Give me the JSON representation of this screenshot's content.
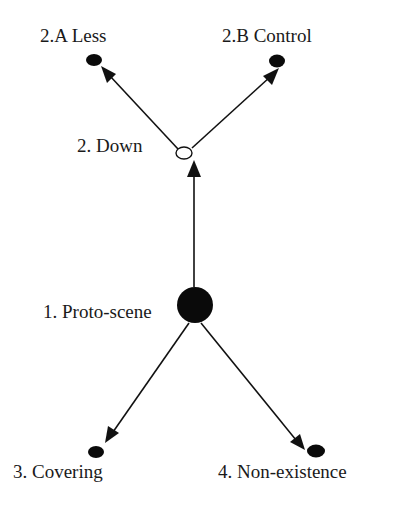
{
  "diagram": {
    "type": "radial-network",
    "colors": {
      "ink": "#111111",
      "text": "#1a1a1a",
      "background": "#ffffff"
    },
    "nodes": [
      {
        "id": "proto",
        "label": "1. Proto-scene",
        "style": "filled-large"
      },
      {
        "id": "down",
        "label": "2. Down",
        "style": "open-small"
      },
      {
        "id": "less",
        "label": "2.A Less",
        "style": "filled-small"
      },
      {
        "id": "control",
        "label": "2.B Control",
        "style": "filled-small"
      },
      {
        "id": "covering",
        "label": "3. Covering",
        "style": "filled-small"
      },
      {
        "id": "nonexistence",
        "label": "4. Non-existence",
        "style": "filled-small"
      }
    ],
    "edges": [
      {
        "from": "proto",
        "to": "down"
      },
      {
        "from": "down",
        "to": "less"
      },
      {
        "from": "down",
        "to": "control"
      },
      {
        "from": "proto",
        "to": "covering"
      },
      {
        "from": "proto",
        "to": "nonexistence"
      }
    ]
  },
  "labels": {
    "proto": "1. Proto-scene",
    "down": "2. Down",
    "less": "2.A Less",
    "control": "2.B Control",
    "covering": "3. Covering",
    "nonexistence": "4. Non-existence"
  }
}
